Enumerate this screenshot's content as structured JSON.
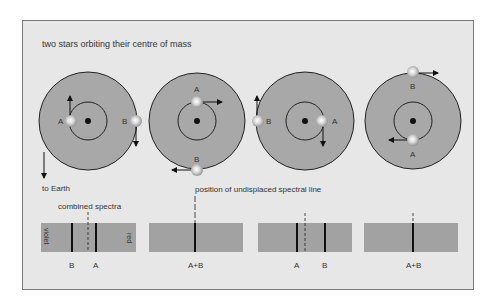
{
  "title": "two stars orbiting their centre of mass",
  "to_earth": "to Earth",
  "undisplaced_label": "position of undisplaced spectral line",
  "combined_label": "combined spectra",
  "violet": "violet",
  "red": "red",
  "colors": {
    "frame_bg": "#e7e7e7",
    "disc": "#a8a8a8",
    "spectrum": "#a2a2a2",
    "line": "#111111",
    "text": "#333333"
  },
  "orbits": [
    {
      "cx": 88,
      "cy": 121,
      "star_a": {
        "label": "A",
        "pos": "left"
      },
      "star_b": {
        "label": "B",
        "pos": "right"
      }
    },
    {
      "cx": 197,
      "cy": 121,
      "star_a": {
        "label": "A",
        "pos": "top"
      },
      "star_b": {
        "label": "B",
        "pos": "bottom"
      }
    },
    {
      "cx": 305,
      "cy": 121,
      "star_a": {
        "label": "A",
        "pos": "right"
      },
      "star_b": {
        "label": "B",
        "pos": "left"
      }
    },
    {
      "cx": 413,
      "cy": 121,
      "star_a": {
        "label": "A",
        "pos": "bottom"
      },
      "star_b": {
        "label": "B",
        "pos": "top"
      }
    }
  ],
  "spectra": [
    {
      "lines": [
        {
          "x": 72,
          "label": "B"
        },
        {
          "x": 96,
          "label": "A"
        }
      ],
      "dashed_x": 88
    },
    {
      "lines": [
        {
          "x": 195,
          "label": "A+B"
        }
      ],
      "dashed_x": 195
    },
    {
      "lines": [
        {
          "x": 297,
          "label": "A"
        },
        {
          "x": 325,
          "label": "B"
        }
      ],
      "dashed_x": 305
    },
    {
      "lines": [
        {
          "x": 413,
          "label": "A+B"
        }
      ],
      "dashed_x": 413
    }
  ]
}
